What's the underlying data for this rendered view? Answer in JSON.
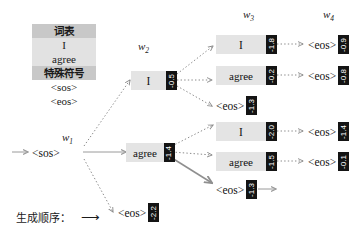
{
  "vocab_table": {
    "header_label": "词表",
    "words": [
      "I",
      "agree"
    ],
    "special_header_label": "特殊符号",
    "special_tokens": [
      "<sos>",
      "<eos>"
    ]
  },
  "step_labels": [
    {
      "name": "w",
      "index": "1"
    },
    {
      "name": "w",
      "index": "2"
    },
    {
      "name": "w",
      "index": "3"
    },
    {
      "name": "w",
      "index": "4"
    }
  ],
  "caption": {
    "text": "生成顺序：",
    "arrow": "⟶"
  },
  "nodes": {
    "start": {
      "token": "<sos>",
      "score": ""
    },
    "w1_agree": {
      "token": "agree",
      "score": "-1.4"
    },
    "w1_eos": {
      "token": "<eos>",
      "score": "-2.2"
    },
    "w2_I": {
      "token": "I",
      "score": "-0.5"
    },
    "w3a_I": {
      "token": "I",
      "score": "-1.8"
    },
    "w3a_agree": {
      "token": "agree",
      "score": "-0.2"
    },
    "w3a_eos": {
      "token": "<eos>",
      "score": "-1.3"
    },
    "w3b_I": {
      "token": "I",
      "score": "-2.0"
    },
    "w3b_agree": {
      "token": "agree",
      "score": "-1.5"
    },
    "w3b_eos": {
      "token": "<eos>",
      "score": "-1.3"
    },
    "w4a_eos_top": {
      "token": "<eos>",
      "score": "-0.9"
    },
    "w4a_eos_bot": {
      "token": "<eos>",
      "score": "-0.8"
    },
    "w4b_eos_top": {
      "token": "<eos>",
      "score": "-1.4"
    },
    "w4b_eos_bot": {
      "token": "<eos>",
      "score": "-0.1"
    }
  },
  "colors": {
    "badge_background": "#141414",
    "badge_text": "#ffffff",
    "node_background": "#e4e4e4",
    "table_header": "#c8c8c8",
    "table_cell": "#e2e2e2",
    "edge_dotted": "#8a8a8a",
    "edge_selected": "#8f8f8f",
    "text": "#1a1a1a"
  }
}
